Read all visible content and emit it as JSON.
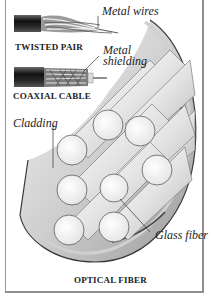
{
  "figure": {
    "sections": [
      {
        "id": "twisted-pair",
        "title": "TWISTED PAIR",
        "callout": "Metal wires"
      },
      {
        "id": "coaxial-cable",
        "title": "COAXIAL CABLE",
        "callout_line1": "Metal",
        "callout_line2": "shielding"
      },
      {
        "id": "optical-fiber",
        "title": "OPTICAL FIBER",
        "callouts": [
          "Cladding",
          "Glass fiber"
        ]
      }
    ]
  },
  "colors": {
    "frame": "#8f8f8f",
    "cable_jacket": "#1e1e1e",
    "fiber_cladding": "#d9d9d9",
    "fiber_outline": "#3a3a3a",
    "background": "#ffffff"
  }
}
